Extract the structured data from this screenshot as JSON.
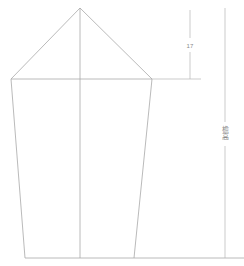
{
  "drawing": {
    "type": "architectural-elevation",
    "background_color": "#ffffff",
    "line_color": "#a8a8a8",
    "dimension_line_color": "#b4b4b4",
    "text_color": "#8a8a8a",
    "building": {
      "apex": {
        "x": 80,
        "y": 8
      },
      "eave_left": {
        "x": 11,
        "y": 79
      },
      "eave_right": {
        "x": 152,
        "y": 79
      },
      "base_left": {
        "x": 25,
        "y": 258
      },
      "base_right": {
        "x": 134,
        "y": 258
      },
      "center_axis_x": 80
    },
    "ground_line": {
      "y": 258,
      "x_start": 25,
      "x_end": 244
    },
    "eave_extension_line": {
      "y": 79,
      "x_start": 152,
      "x_end": 201
    },
    "dimensions": [
      {
        "name": "roof-height",
        "label": "17",
        "label_x": 190,
        "label_y": 46,
        "line_x": 190,
        "y_top": 10,
        "y_bottom": 79,
        "gap_top": 38,
        "gap_bottom": 52
      },
      {
        "name": "total-height",
        "label": "檐高",
        "label_x": 225,
        "label_y": 133,
        "line_x": 225,
        "y_top": 8,
        "y_bottom": 258,
        "gap_top": 122,
        "gap_bottom": 146,
        "orientation": "vertical"
      }
    ]
  }
}
